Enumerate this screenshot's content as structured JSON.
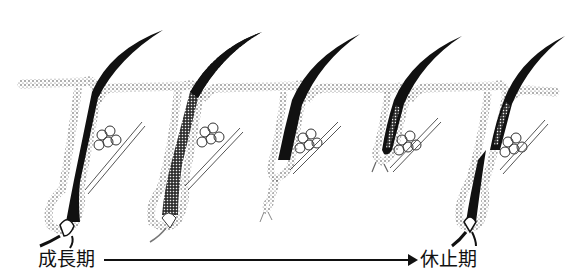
{
  "diagram": {
    "stage_count": 5,
    "stages": [
      {
        "index": 1,
        "description": "anagen follicle, deep bulb with dermal papilla, thick dark hair shaft"
      },
      {
        "index": 2,
        "description": "follicle beginning regression, stippled dense bulb"
      },
      {
        "index": 3,
        "description": "catagen, shrinking follicle with thin trailing strand"
      },
      {
        "index": 4,
        "description": "telogen, club hair near surface, short follicle"
      },
      {
        "index": 5,
        "description": "new anagen follicle growing beneath club hair"
      }
    ],
    "colors": {
      "ink": "#111111",
      "background": "#ffffff"
    }
  },
  "labels": {
    "start": "成長期",
    "end": "休止期"
  },
  "arrow": {
    "direction": "right"
  }
}
